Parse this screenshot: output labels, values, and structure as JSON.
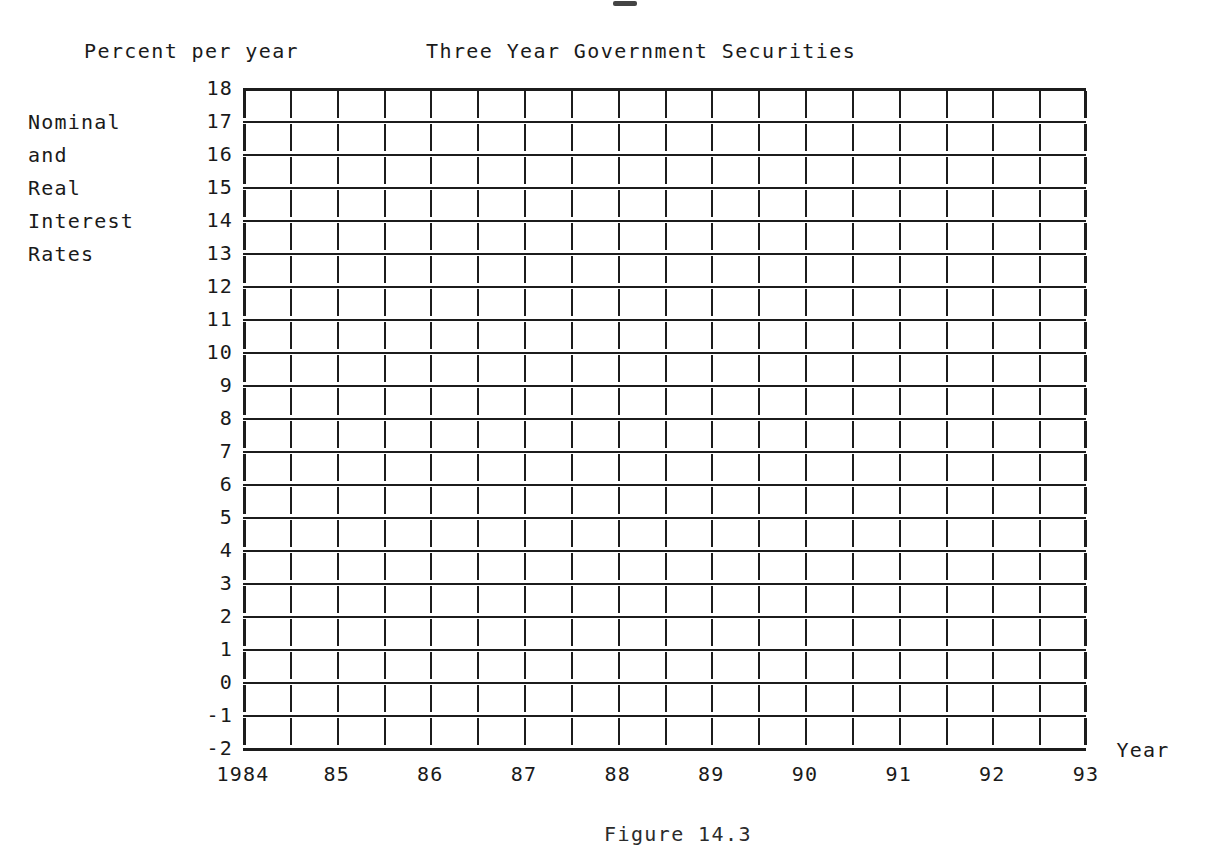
{
  "header": {
    "axis_unit_label": "Percent per year",
    "title": "Three Year Government Securities"
  },
  "side_caption": {
    "lines": [
      "Nominal",
      "and",
      "Real",
      "Interest",
      "Rates"
    ]
  },
  "footer": {
    "figure_caption": "Figure 14.3"
  },
  "axes": {
    "x_axis_name": "Year",
    "y_axis_name": "Percent per year"
  },
  "chart_data": {
    "type": "line",
    "title": "Three Year Government Securities",
    "subtitle": "Percent per year",
    "xlabel": "Year",
    "ylabel": "Nominal and Real Interest Rates",
    "grid": true,
    "legend": null,
    "note": "Blank worksheet grid — no data series are plotted in the figure.",
    "series": [],
    "x": [
      1984,
      1985,
      1986,
      1987,
      1988,
      1989,
      1990,
      1991,
      1992,
      1993
    ],
    "xlim": [
      1984,
      1993.5
    ],
    "x_tick_labels": [
      "1984",
      "85",
      "86",
      "87",
      "88",
      "89",
      "90",
      "91",
      "92",
      "93"
    ],
    "x_minor_ticks_per_interval": 2,
    "ylim": [
      -2,
      18
    ],
    "y_ticks": [
      18,
      17,
      16,
      15,
      14,
      13,
      12,
      11,
      10,
      9,
      8,
      7,
      6,
      5,
      4,
      3,
      2,
      1,
      0,
      -1,
      -2
    ],
    "y_tick_labels": [
      "18",
      "17",
      "16",
      "15",
      "14",
      "13",
      "12",
      "11",
      "10",
      "9",
      "8",
      "7",
      "6",
      "5",
      "4",
      "3",
      "2",
      "1",
      "0",
      "-1",
      "-2"
    ]
  },
  "colors": {
    "ink": "#1c1c1c",
    "paper": "#ffffff"
  }
}
